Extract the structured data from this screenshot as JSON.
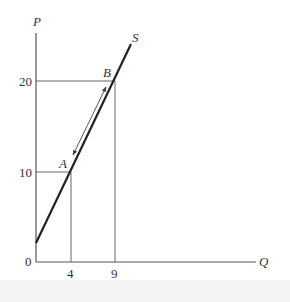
{
  "diagram": {
    "type": "supply-curve",
    "axes": {
      "y_label": "P",
      "x_label": "Q",
      "origin_label": "0"
    },
    "y_ticks": [
      {
        "label": "20",
        "value": 20
      },
      {
        "label": "10",
        "value": 10
      }
    ],
    "x_ticks": [
      {
        "label": "4",
        "value": 4
      },
      {
        "label": "9",
        "value": 9
      }
    ],
    "curve": {
      "label": "S",
      "color": "#222222"
    },
    "points": [
      {
        "label": "A",
        "Q": 4,
        "P": 10
      },
      {
        "label": "B",
        "Q": 9,
        "P": 20
      }
    ],
    "arrow": {
      "from": "A",
      "to": "B",
      "style": "double-headed"
    },
    "line_color": "#555555"
  }
}
